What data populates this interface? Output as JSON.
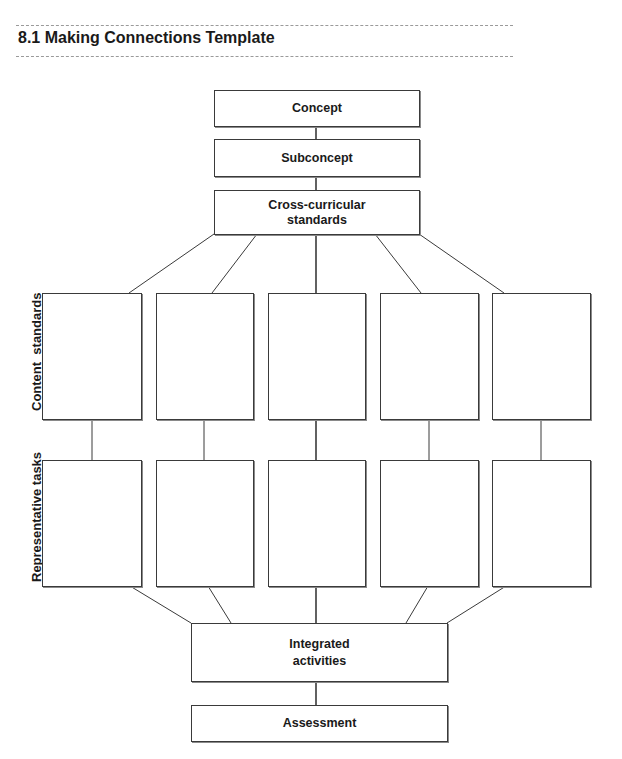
{
  "header": {
    "title": "8.1 Making Connections Template"
  },
  "diagram": {
    "top_boxes": [
      {
        "label": "Concept"
      },
      {
        "label": "Subconcept"
      },
      {
        "label": "Cross-curricular\nstandards"
      }
    ],
    "row_labels": {
      "content": "Content  standards",
      "tasks": "Representative tasks"
    },
    "content_standards_boxes": [
      "",
      "",
      "",
      "",
      ""
    ],
    "representative_tasks_boxes": [
      "",
      "",
      "",
      "",
      ""
    ],
    "bottom_boxes": [
      {
        "label": "Integrated\nactivities"
      },
      {
        "label": "Assessment"
      }
    ],
    "colors": {
      "line": "#3a3a3a",
      "rule": "#9a9a9a"
    }
  }
}
